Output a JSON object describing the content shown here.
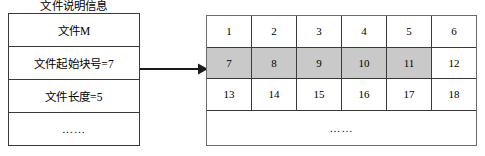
{
  "diagram": {
    "title": "文件说明信息",
    "file_control_block": {
      "name": "file-control-block",
      "rows": [
        {
          "label": "文件M"
        },
        {
          "label": "文件起始块号=7"
        },
        {
          "label": "文件长度=5"
        },
        {
          "label": "……"
        }
      ]
    },
    "arrow": {
      "name": "pointer-arrow",
      "direction": "right",
      "from": "文件起始块号=7",
      "to": "7"
    },
    "disk_blocks": {
      "name": "disk-block-grid",
      "columns": 6,
      "rows": [
        [
          "1",
          "2",
          "3",
          "4",
          "5",
          "6"
        ],
        [
          "7",
          "8",
          "9",
          "10",
          "11",
          "12"
        ],
        [
          "13",
          "14",
          "15",
          "16",
          "17",
          "18"
        ]
      ],
      "shaded_blocks": [
        "7",
        "8",
        "9",
        "10",
        "11"
      ],
      "tail_label": "……"
    },
    "colors": {
      "shaded_fill": "#c9c9c9",
      "border": "#3a3a3a",
      "outer_border": "#6b6b6b",
      "background": "#ffffff",
      "text": "#000000"
    }
  }
}
